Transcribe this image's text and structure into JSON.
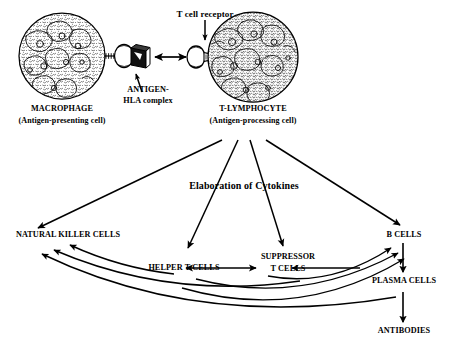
{
  "diagram": {
    "ink_color": "#000000",
    "background_color": "#ffffff",
    "cells": {
      "macrophage": {
        "name": "MACROPHAGE",
        "subtitle": "(Antigen-presenting cell)"
      },
      "t_lymphocyte": {
        "name": "T-LYMPHOCYTE",
        "subtitle": "(Antigen-processing cell)"
      }
    },
    "callouts": {
      "t_cell_receptor": "T cell receptor",
      "antigen_hla_line1": "ANTIGEN-",
      "antigen_hla_line2": "HLA complex"
    },
    "process": {
      "cytokines": "Elaboration of Cytokines"
    },
    "effectors": {
      "natural_killer": "NATURAL KILLER CELLS",
      "helper_t": "HELPER T CELLS",
      "suppressor_line1": "SUPPRESSOR",
      "suppressor_line2": "T CELLS",
      "b_cells": "B CELLS",
      "plasma_cells": "PLASMA CELLS",
      "antibodies": "ANTIBODIES"
    }
  }
}
